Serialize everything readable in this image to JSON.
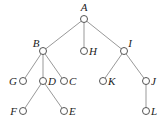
{
  "diagram": {
    "type": "tree",
    "nodes": [
      {
        "id": "A",
        "label": "A",
        "x": 84,
        "y": 19,
        "lx": 84,
        "ly": 11,
        "anchor": "middle"
      },
      {
        "id": "B",
        "label": "B",
        "x": 43,
        "y": 51,
        "lx": 36,
        "ly": 47,
        "anchor": "middle"
      },
      {
        "id": "H",
        "label": "H",
        "x": 84,
        "y": 51,
        "lx": 89,
        "ly": 55,
        "anchor": "start"
      },
      {
        "id": "I",
        "label": "I",
        "x": 124,
        "y": 51,
        "lx": 130,
        "ly": 47,
        "anchor": "middle"
      },
      {
        "id": "G",
        "label": "G",
        "x": 23,
        "y": 81,
        "lx": 17,
        "ly": 85,
        "anchor": "end"
      },
      {
        "id": "D",
        "label": "D",
        "x": 43,
        "y": 81,
        "lx": 48,
        "ly": 85,
        "anchor": "start"
      },
      {
        "id": "C",
        "label": "C",
        "x": 64,
        "y": 81,
        "lx": 69,
        "ly": 85,
        "anchor": "start"
      },
      {
        "id": "K",
        "label": "K",
        "x": 103,
        "y": 81,
        "lx": 108,
        "ly": 85,
        "anchor": "start"
      },
      {
        "id": "J",
        "label": "J",
        "x": 146,
        "y": 81,
        "lx": 151,
        "ly": 85,
        "anchor": "start"
      },
      {
        "id": "F",
        "label": "F",
        "x": 23,
        "y": 111,
        "lx": 17,
        "ly": 115,
        "anchor": "end"
      },
      {
        "id": "E",
        "label": "E",
        "x": 64,
        "y": 111,
        "lx": 69,
        "ly": 115,
        "anchor": "start"
      },
      {
        "id": "L",
        "label": "L",
        "x": 146,
        "y": 111,
        "lx": 151,
        "ly": 115,
        "anchor": "start"
      }
    ],
    "edges": [
      [
        "A",
        "B"
      ],
      [
        "A",
        "H"
      ],
      [
        "A",
        "I"
      ],
      [
        "B",
        "G"
      ],
      [
        "B",
        "D"
      ],
      [
        "B",
        "C"
      ],
      [
        "D",
        "F"
      ],
      [
        "D",
        "E"
      ],
      [
        "I",
        "K"
      ],
      [
        "I",
        "J"
      ],
      [
        "J",
        "L"
      ]
    ],
    "colors": {
      "line": "#999999",
      "node_stroke": "#555555",
      "label": "#222222"
    }
  }
}
